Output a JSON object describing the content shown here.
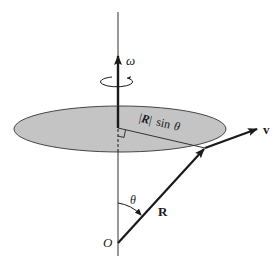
{
  "diagram": {
    "type": "rotating-disk-angular-velocity",
    "labels": {
      "omega": "ω",
      "radius_expr_bar_open": "|",
      "radius_expr_R": "R",
      "radius_expr_bar_close": "|",
      "radius_expr_sin": "sin",
      "radius_expr_theta": "θ",
      "velocity": "v",
      "theta": "θ",
      "position": "R",
      "origin": "O"
    },
    "colors": {
      "disk_fill": "#c4c4c4",
      "line": "#1a1a1a",
      "background": "#ffffff"
    }
  }
}
